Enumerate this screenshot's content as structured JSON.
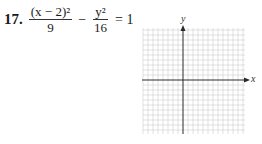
{
  "problem": {
    "number": "17.",
    "term1": {
      "numerator": "(x − 2)²",
      "denominator": "9"
    },
    "operator": "−",
    "term2": {
      "numerator": "y²",
      "denominator": "16"
    },
    "rhs": "= 1"
  },
  "graph": {
    "x_label": "x",
    "y_label": "y",
    "grid_color": "#c8c8c8",
    "axis_color": "#2a2a2a"
  }
}
